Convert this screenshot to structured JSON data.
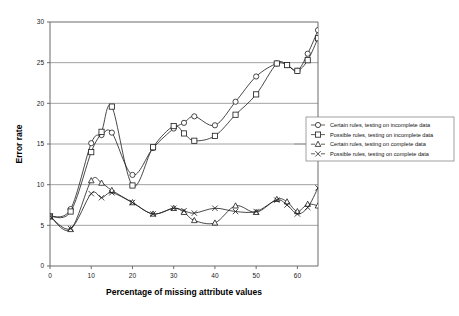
{
  "chart_data": {
    "type": "line",
    "title": "",
    "xlabel": "Percentage of missing attribute values",
    "ylabel": "Error rate",
    "xlim": [
      0,
      65
    ],
    "ylim": [
      0,
      30
    ],
    "xticks": [
      0,
      10,
      20,
      30,
      40,
      50,
      60
    ],
    "yticks": [
      0,
      5,
      10,
      15,
      20,
      25,
      30
    ],
    "grid": "horizontal",
    "legend_position": "right",
    "x": [
      0,
      5,
      10,
      12.5,
      15,
      20,
      25,
      30,
      32.5,
      35,
      40,
      45,
      50,
      55,
      57.5,
      60,
      62.5,
      65
    ],
    "series": [
      {
        "name": "Certain rules, testing on incomplete data",
        "marker": "circle",
        "values": [
          6.1,
          7.0,
          15.1,
          16.1,
          16.4,
          11.2,
          14.5,
          16.9,
          17.6,
          18.4,
          17.3,
          20.2,
          23.3,
          24.9,
          24.7,
          24.0,
          26.1,
          29.0
        ]
      },
      {
        "name": "Possible rules, testing on incomplete data",
        "marker": "square",
        "values": [
          6.1,
          6.7,
          14.0,
          16.5,
          19.6,
          9.9,
          14.6,
          17.2,
          16.3,
          15.4,
          16.0,
          18.6,
          21.1,
          24.9,
          24.7,
          24.0,
          25.3,
          28.0
        ]
      },
      {
        "name": "Certain rules, testing on complete data",
        "marker": "triangle",
        "values": [
          6.1,
          4.5,
          10.5,
          10.2,
          9.3,
          7.8,
          6.4,
          7.1,
          6.6,
          5.6,
          5.3,
          7.4,
          6.6,
          8.2,
          7.9,
          6.7,
          7.6,
          7.4
        ]
      },
      {
        "name": "Possible rules, testing on complete data",
        "marker": "x",
        "values": [
          6.1,
          4.6,
          8.9,
          8.4,
          9.0,
          7.8,
          6.4,
          7.1,
          6.8,
          6.5,
          7.1,
          6.7,
          6.7,
          8.1,
          7.5,
          6.4,
          7.2,
          9.6
        ]
      }
    ],
    "legend_entries": [
      "Certain rules, testing on incomplete data",
      "Possible rules, testing on incomplete data",
      "Certain rules, testing on complete data",
      "Possible rules, testing on complete data"
    ]
  }
}
